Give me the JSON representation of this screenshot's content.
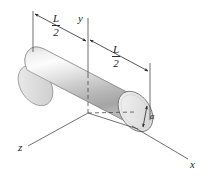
{
  "figure": {
    "background_color": "#ffffff",
    "line_color": "#3a3a3a",
    "labels": {
      "axis_x": "x",
      "axis_y": "y",
      "axis_z": "z",
      "radius": "a",
      "length_left_numerator": "L",
      "length_left_denominator": "2",
      "length_right_numerator": "L",
      "length_right_denominator": "2"
    },
    "body": {
      "shape": "cylinder",
      "fill_light": "#f4f4f4",
      "fill_mid": "#c9c9c9",
      "fill_highlight": "#fdfdfd",
      "fill_dark": "#9d9d9d",
      "end_cap_fill": "#e8e8e8",
      "outline_color": "#6e6e6e"
    },
    "dimensions": [
      {
        "name": "left-half-length",
        "label": "L/2"
      },
      {
        "name": "right-half-length",
        "label": "L/2"
      },
      {
        "name": "radius",
        "label": "a"
      }
    ],
    "axes": [
      {
        "name": "x",
        "label": "x",
        "direction": "lower-right"
      },
      {
        "name": "y",
        "label": "y",
        "direction": "up"
      },
      {
        "name": "z",
        "label": "z",
        "direction": "lower-left"
      }
    ]
  }
}
